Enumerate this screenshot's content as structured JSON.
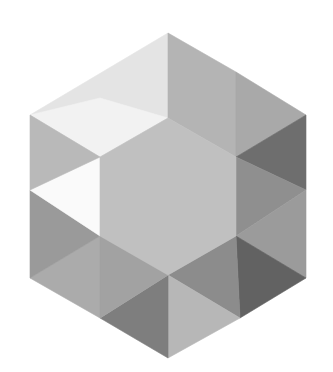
{
  "image": {
    "title": "Hexagonal gem icon",
    "background": "#ffffff",
    "width": 333,
    "height": 372
  },
  "gem": {
    "icon": "hexagon-gem-icon",
    "facets": [
      {
        "name": "top-left-upper",
        "points": "168,33 168,118 100,157 30,115",
        "fill": "#e4e4e4"
      },
      {
        "name": "top-left-white",
        "points": "100,98 168,118 100,157 30,115",
        "fill": "#f2f2f2"
      },
      {
        "name": "top-right-upper",
        "points": "168,33 236,72 236,157 168,118",
        "fill": "#b4b4b4"
      },
      {
        "name": "top-right-outer",
        "points": "236,72 306,115 236,157",
        "fill": "#a9a9a9"
      },
      {
        "name": "right-dark-top",
        "points": "236,157 306,115 306,190",
        "fill": "#6e6e6e"
      },
      {
        "name": "right-mid",
        "points": "236,157 306,190 236,236",
        "fill": "#8f8f8f"
      },
      {
        "name": "right-mid-lower",
        "points": "306,190 306,278 236,236",
        "fill": "#9b9b9b"
      },
      {
        "name": "right-dark-bottom",
        "points": "236,236 306,278 240,318",
        "fill": "#626262"
      },
      {
        "name": "bottom-right",
        "points": "168,275 236,236 240,318",
        "fill": "#8c8c8c"
      },
      {
        "name": "bottom-right-lower",
        "points": "168,275 240,318 168,358",
        "fill": "#b7b7b7"
      },
      {
        "name": "bottom-left-lower",
        "points": "168,275 168,358 100,318",
        "fill": "#7e7e7e"
      },
      {
        "name": "bottom-left",
        "points": "100,236 168,275 100,318 30,278",
        "fill": "#ababab"
      },
      {
        "name": "bottom-left-overlap",
        "points": "100,236 168,275 100,318",
        "fill": "#a2a2a2"
      },
      {
        "name": "left-lower",
        "points": "30,190 100,236 30,278",
        "fill": "#9a9a9a"
      },
      {
        "name": "left-white",
        "points": "30,190 100,157 100,236",
        "fill": "#fafafa"
      },
      {
        "name": "left-upper",
        "points": "30,115 100,157 30,190",
        "fill": "#b9b9b9"
      },
      {
        "name": "center",
        "points": "168,118 236,157 236,236 168,275 100,236 100,157",
        "fill": "#c0c0c0"
      }
    ]
  }
}
